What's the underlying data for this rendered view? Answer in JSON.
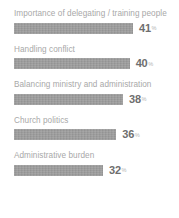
{
  "chart_data": {
    "type": "bar",
    "orientation": "horizontal",
    "title": "",
    "subtitle": "",
    "xlabel": "",
    "ylabel": "",
    "grid": false,
    "legend": null,
    "value_suffix": "%",
    "xlim": [
      0,
      41
    ],
    "categories": [
      "Importance of delegating / training people",
      "Handling conflict",
      "Balancing ministry and administration",
      "Church politics",
      "Administrative burden"
    ],
    "values": [
      41,
      40,
      38,
      36,
      32
    ],
    "bars": [
      {
        "label": "Importance of delegating / training people",
        "value": 41,
        "value_text": "41",
        "suffix": "%"
      },
      {
        "label": "Handling conflict",
        "value": 40,
        "value_text": "40",
        "suffix": "%"
      },
      {
        "label": "Balancing ministry and administration",
        "value": 38,
        "value_text": "38",
        "suffix": "%"
      },
      {
        "label": "Church politics",
        "value": 36,
        "value_text": "36",
        "suffix": "%"
      },
      {
        "label": "Administrative burden",
        "value": 32,
        "value_text": "32",
        "suffix": "%"
      }
    ],
    "colors": {
      "background": "#ffffff",
      "bar": "#9c9c9c",
      "label_text": "#a8a8a8",
      "value_text": "#6e6e6e",
      "suffix_text": "#b3b3b3"
    }
  }
}
